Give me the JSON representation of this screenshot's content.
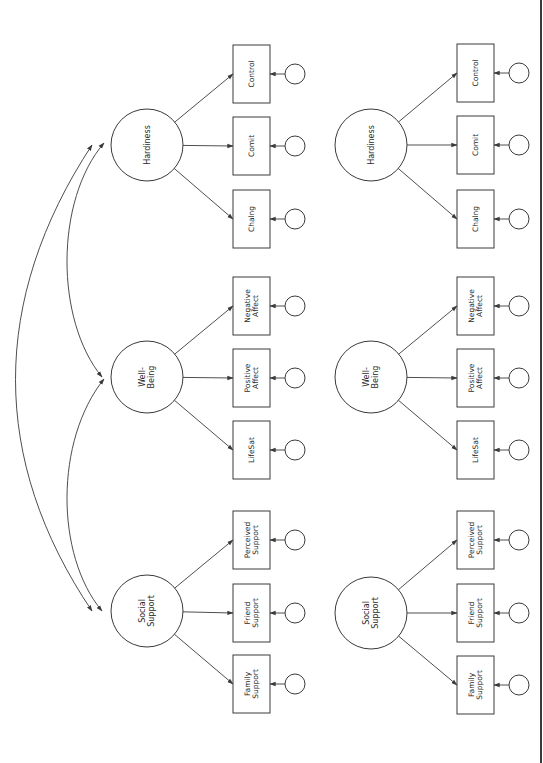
{
  "figure": {
    "orientation": "rotated-90",
    "colors": {
      "stroke": "#3a3a3a",
      "text": "#2a2a2a",
      "background": "#ffffff"
    }
  },
  "models": [
    {
      "id": "model-a",
      "has_correlations": true,
      "latents": [
        {
          "key": "hardiness",
          "lines": [
            "Hardiness"
          ],
          "cx": 147,
          "cy": 145,
          "indicators": [
            {
              "key": "control",
              "lines": [
                "Control"
              ],
              "y": 45
            },
            {
              "key": "comit",
              "lines": [
                "Comit"
              ],
              "y": 117
            },
            {
              "key": "chalng",
              "lines": [
                "Chalng"
              ],
              "y": 190
            }
          ]
        },
        {
          "key": "well-being",
          "lines": [
            "Well-",
            "Being"
          ],
          "cx": 147,
          "cy": 377,
          "indicators": [
            {
              "key": "negative-affect",
              "lines": [
                "Negative",
                "Affect"
              ],
              "y": 277
            },
            {
              "key": "positive-affect",
              "lines": [
                "Positive",
                "Affect"
              ],
              "y": 349
            },
            {
              "key": "lifesat",
              "lines": [
                "LifeSat"
              ],
              "y": 421
            }
          ]
        },
        {
          "key": "social-support",
          "lines": [
            "Social",
            "Support"
          ],
          "cx": 147,
          "cy": 611,
          "indicators": [
            {
              "key": "perceived-support",
              "lines": [
                "Perceived",
                "Support"
              ],
              "y": 511
            },
            {
              "key": "friend-support",
              "lines": [
                "Friend",
                "Support"
              ],
              "y": 584
            },
            {
              "key": "family-support",
              "lines": [
                "Family",
                "Support"
              ],
              "y": 655
            }
          ]
        }
      ],
      "box_x": 233,
      "error_cx": 295
    },
    {
      "id": "model-b",
      "has_correlations": false,
      "latents": [
        {
          "key": "hardiness",
          "lines": [
            "Hardiness"
          ],
          "cx": 371,
          "cy": 145,
          "indicators": [
            {
              "key": "control",
              "lines": [
                "Control"
              ],
              "y": 44
            },
            {
              "key": "comit",
              "lines": [
                "Comit"
              ],
              "y": 116
            },
            {
              "key": "chalng",
              "lines": [
                "Chalng"
              ],
              "y": 190
            }
          ]
        },
        {
          "key": "well-being",
          "lines": [
            "Well-",
            "Being"
          ],
          "cx": 371,
          "cy": 377,
          "indicators": [
            {
              "key": "negative-affect",
              "lines": [
                "Negative",
                "Affect"
              ],
              "y": 277
            },
            {
              "key": "positive-affect",
              "lines": [
                "Positive",
                "Affect"
              ],
              "y": 349
            },
            {
              "key": "lifesat",
              "lines": [
                "LifeSat"
              ],
              "y": 421
            }
          ]
        },
        {
          "key": "social-support",
          "lines": [
            "Social",
            "Support"
          ],
          "cx": 371,
          "cy": 613,
          "indicators": [
            {
              "key": "perceived-support",
              "lines": [
                "Perceived",
                "Support"
              ],
              "y": 511
            },
            {
              "key": "friend-support",
              "lines": [
                "Friend",
                "Support"
              ],
              "y": 584
            },
            {
              "key": "family-support",
              "lines": [
                "Family",
                "Support"
              ],
              "y": 656
            }
          ]
        }
      ],
      "box_x": 457,
      "error_cx": 519
    }
  ],
  "correlations": [
    {
      "from": "hardiness",
      "to": "social-support",
      "path": "M 92 145 C -10 300, -10 460, 92 611"
    },
    {
      "from": "hardiness",
      "to": "well-being",
      "path": "M 104 143 C 55 200, 55 320, 102 377"
    },
    {
      "from": "well-being",
      "to": "social-support",
      "path": "M 104 379 C 55 440, 55 555, 102 611"
    }
  ],
  "dimensions": {
    "latent_r": 36,
    "box_w": 37,
    "box_h": 58,
    "error_r": 10
  }
}
